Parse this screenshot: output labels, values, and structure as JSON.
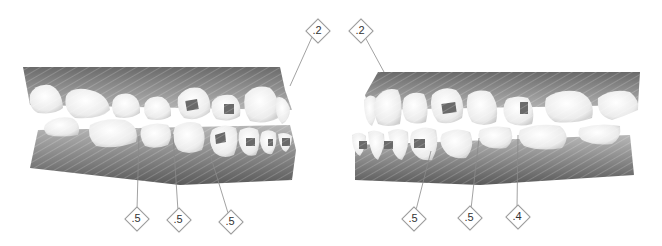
{
  "diagram": {
    "type": "dental-ipr-chart",
    "views": [
      {
        "id": "right-side-view",
        "labels": [
          {
            "value": ".2",
            "x": 317,
            "y": 30,
            "target_x": 290,
            "target_y": 86
          },
          {
            "value": ".5",
            "x": 136,
            "y": 218,
            "target_x": 139,
            "target_y": 136
          },
          {
            "value": ".5",
            "x": 178,
            "y": 219,
            "target_x": 173,
            "target_y": 134
          },
          {
            "value": ".5",
            "x": 230,
            "y": 221,
            "target_x": 209,
            "target_y": 151
          }
        ]
      },
      {
        "id": "left-side-view",
        "labels": [
          {
            "value": ".2",
            "x": 360,
            "y": 30,
            "target_x": 384,
            "target_y": 72
          },
          {
            "value": ".5",
            "x": 413,
            "y": 218,
            "target_x": 431,
            "target_y": 151
          },
          {
            "value": ".5",
            "x": 469,
            "y": 217,
            "target_x": 479,
            "target_y": 138
          },
          {
            "value": ".4",
            "x": 517,
            "y": 216,
            "target_x": 518,
            "target_y": 135
          }
        ]
      }
    ],
    "colors": {
      "gum_dark": "#5e5e5e",
      "gum_light": "#a8a8a8",
      "tooth": "#f2f2f2",
      "tooth_shadow": "#cfcfcf",
      "attachment": "#6a6a6a",
      "leader_line": "#8a8a8a",
      "label_border": "#9a9a9a",
      "label_text": "#333333"
    }
  }
}
